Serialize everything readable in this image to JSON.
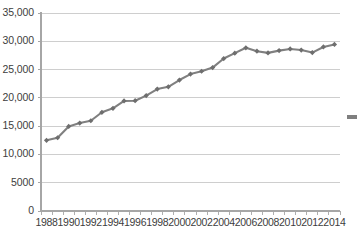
{
  "chart_data": {
    "type": "line",
    "title": "",
    "subtitle": "",
    "xlabel": "",
    "ylabel": "",
    "xlim": [
      1987.5,
      2014.5
    ],
    "ylim": [
      0,
      35000
    ],
    "grid": true,
    "grid_axis": "y",
    "legend": "cropped-marker-right-edge",
    "marker": "diamond",
    "line_color": "#808080",
    "marker_color": "#6e6e6e",
    "x": [
      1988,
      1989,
      1990,
      1991,
      1992,
      1993,
      1994,
      1995,
      1996,
      1997,
      1998,
      1999,
      2000,
      2001,
      2002,
      2003,
      2004,
      2005,
      2006,
      2007,
      2008,
      2009,
      2010,
      2011,
      2012,
      2013,
      2014
    ],
    "values": [
      12500,
      12950,
      14950,
      15550,
      15950,
      17450,
      18150,
      19450,
      19500,
      20400,
      21550,
      21950,
      23150,
      24200,
      24700,
      25350,
      26950,
      27900,
      28850,
      28250,
      27950,
      28350,
      28650,
      28450,
      28000,
      29000,
      29450
    ],
    "categories": [
      "1988",
      "1989",
      "1990",
      "1991",
      "1992",
      "1993",
      "1994",
      "1995",
      "1996",
      "1997",
      "1998",
      "1999",
      "2000",
      "2001",
      "2002",
      "2003",
      "2004",
      "2005",
      "2006",
      "2007",
      "2008",
      "2009",
      "2010",
      "2011",
      "2012",
      "2013",
      "2014"
    ],
    "series": [
      {
        "name": "",
        "values": [
          12500,
          12950,
          14950,
          15550,
          15950,
          17450,
          18150,
          19450,
          19500,
          20400,
          21550,
          21950,
          23150,
          24200,
          24700,
          25350,
          26950,
          27900,
          28850,
          28250,
          27950,
          28350,
          28650,
          28450,
          28000,
          29000,
          29450
        ]
      }
    ],
    "y_axis": {
      "ticks": [
        0,
        5000,
        10000,
        15000,
        20000,
        25000,
        30000,
        35000
      ],
      "tick_labels": [
        "0",
        "5000",
        "10,000",
        "15,000",
        "20,000",
        "25,000",
        "30,000",
        "35,000"
      ]
    },
    "x_axis": {
      "ticks": [
        1988,
        1989,
        1990,
        1991,
        1992,
        1993,
        1994,
        1995,
        1996,
        1997,
        1998,
        1999,
        2000,
        2001,
        2002,
        2003,
        2004,
        2005,
        2006,
        2007,
        2008,
        2009,
        2010,
        2011,
        2012,
        2013,
        2014
      ],
      "labeled_ticks": [
        1988,
        1990,
        1992,
        1994,
        1996,
        1998,
        2000,
        2002,
        2004,
        2006,
        2008,
        2010,
        2012,
        2014
      ],
      "tick_labels": [
        "1988",
        "1990",
        "1992",
        "1994",
        "1996",
        "1998",
        "2000",
        "2002",
        "2004",
        "2006",
        "2008",
        "2010",
        "2012",
        "2014"
      ]
    }
  },
  "colors": {
    "background": "#ffffff",
    "gridline": "#c9c9c9",
    "axis": "#a6a6a6",
    "text": "#3d3d3d",
    "series_line": "#808080",
    "series_marker": "#6e6e6e",
    "legend_marker": "#7f7f7f"
  }
}
